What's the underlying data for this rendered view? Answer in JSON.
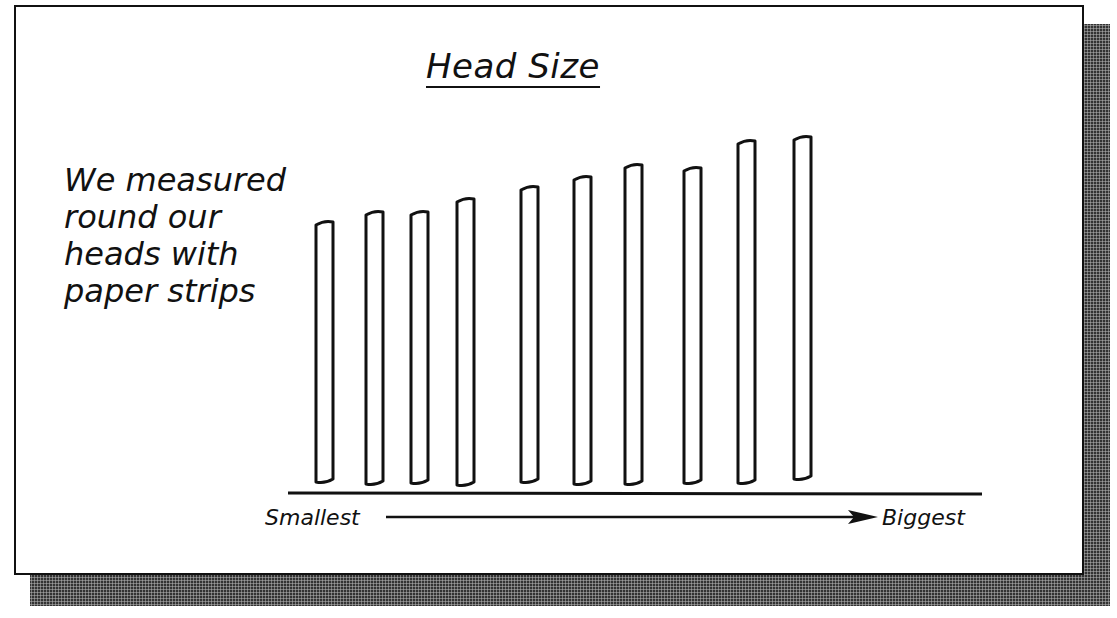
{
  "chart_data": {
    "type": "bar",
    "title": "Head Size",
    "annotation": "We measured\nround our\nheads with\npaper strips",
    "xlabel_left": "Smallest",
    "xlabel_right": "Biggest",
    "ylabel": "",
    "categories": [
      "1",
      "2",
      "3",
      "4",
      "5",
      "6",
      "7",
      "8",
      "9",
      "10"
    ],
    "values": [
      258,
      270,
      271,
      284,
      297,
      307,
      320,
      316,
      344,
      346
    ],
    "units": "relative paper-strip length (px, unlabeled)",
    "grid": false,
    "legend": null,
    "colors": {
      "bar_fill": "#ffffff",
      "bar_stroke": "#111111",
      "shadow": "#333333"
    }
  },
  "bars": [
    {
      "x": 316,
      "top": 222,
      "bottom": 482
    },
    {
      "x": 366,
      "top": 212,
      "bottom": 484
    },
    {
      "x": 411,
      "top": 212,
      "bottom": 483
    },
    {
      "x": 457,
      "top": 199,
      "bottom": 485
    },
    {
      "x": 521,
      "top": 187,
      "bottom": 482
    },
    {
      "x": 574,
      "top": 177,
      "bottom": 484
    },
    {
      "x": 625,
      "top": 165,
      "bottom": 484
    },
    {
      "x": 684,
      "top": 168,
      "bottom": 483
    },
    {
      "x": 738,
      "top": 141,
      "bottom": 483
    },
    {
      "x": 794,
      "top": 137,
      "bottom": 479
    }
  ]
}
